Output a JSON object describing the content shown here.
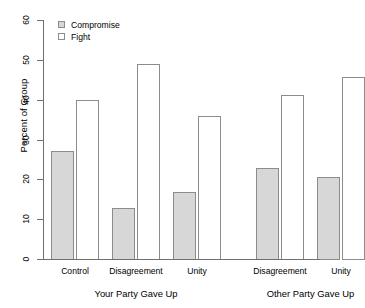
{
  "chart_data": {
    "type": "bar",
    "title": "",
    "xlabel": "",
    "ylabel": "Percent of Group",
    "ylim": [
      0,
      60
    ],
    "yticks": [
      0,
      10,
      20,
      30,
      40,
      50,
      60
    ],
    "grid": false,
    "legend_position": "top-left",
    "categories": [
      "Control",
      "Disagreement",
      "Unity",
      "Disagreement",
      "Unity"
    ],
    "panels": [
      {
        "label": "Your Party Gave Up",
        "categories": [
          "Control",
          "Disagreement",
          "Unity"
        ]
      },
      {
        "label": "Other Party Gave Up",
        "categories": [
          "Disagreement",
          "Unity"
        ]
      }
    ],
    "series": [
      {
        "name": "Compromise",
        "color": "#d7d7d7",
        "values": [
          27.0,
          12.8,
          16.8,
          22.8,
          20.6
        ]
      },
      {
        "name": "Fight",
        "color": "#ffffff",
        "values": [
          40.0,
          49.0,
          35.9,
          41.2,
          45.8
        ]
      }
    ]
  },
  "axis": {
    "y_title": "Percent of Group",
    "y_tick_labels": [
      "0",
      "10",
      "20",
      "30",
      "40",
      "50",
      "60"
    ]
  },
  "legend": {
    "items": [
      {
        "label": "Compromise",
        "swatch": "filled-grey-square-icon"
      },
      {
        "label": "Fight",
        "swatch": "empty-square-icon"
      }
    ]
  },
  "x_labels": [
    "Control",
    "Disagreement",
    "Unity",
    "Disagreement",
    "Unity"
  ],
  "panel_labels": [
    "Your Party Gave Up",
    "Other Party Gave Up"
  ]
}
